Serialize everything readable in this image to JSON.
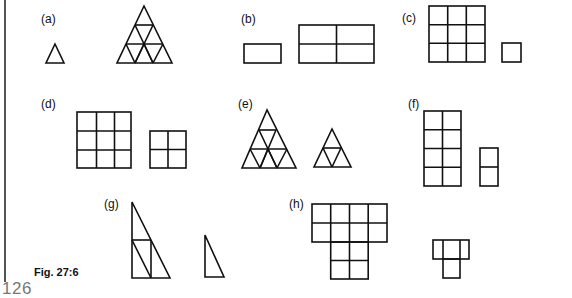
{
  "page": {
    "page_number": "126",
    "figure_caption": "Fig. 27:6"
  },
  "figure": {
    "panels": [
      {
        "id": "a",
        "label": "(a)",
        "description": "Small triangle and large triangle subdivided into 9 small triangles"
      },
      {
        "id": "b",
        "label": "(b)",
        "description": "Small rectangle and large rectangle subdivided into 4 rectangles (2x2)"
      },
      {
        "id": "c",
        "label": "(c)",
        "description": "3x3 grid of squares and a single square"
      },
      {
        "id": "d",
        "label": "(d)",
        "description": "3x3 grid of squares and 2x2 grid of squares"
      },
      {
        "id": "e",
        "label": "(e)",
        "description": "Triangle subdivided into 9 triangles and triangle subdivided into 4 triangles"
      },
      {
        "id": "f",
        "label": "(f)",
        "description": "4x2 grid of squares and 2x1 grid of squares"
      },
      {
        "id": "g",
        "label": "(g)",
        "description": "Large right triangle subdivided into 4 right triangles and a small right triangle"
      },
      {
        "id": "h",
        "label": "(h)",
        "description": "T-shaped grid of 12 squares and small T-shape of 4 squares"
      }
    ]
  }
}
